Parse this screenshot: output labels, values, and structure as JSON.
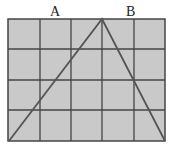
{
  "diagram": {
    "type": "grid-triangle",
    "grid": {
      "columns": 5,
      "rows": 4,
      "fill": "#c9c9c9",
      "line_color": "#444444"
    },
    "labels": [
      {
        "text": "A",
        "x": 50,
        "y": 6
      },
      {
        "text": "B",
        "x": 126,
        "y": 6
      }
    ],
    "triangle": {
      "vertices": [
        [
          9,
          141
        ],
        [
          102,
          19
        ],
        [
          165,
          141
        ]
      ],
      "stroke": "#555555"
    }
  }
}
